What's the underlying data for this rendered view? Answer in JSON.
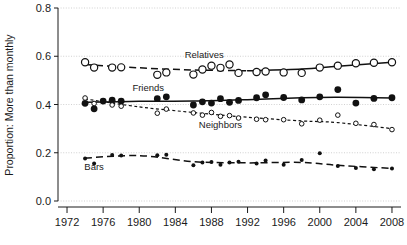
{
  "chart_data": {
    "type": "scatter",
    "title": "",
    "xlabel": "",
    "ylabel": "Proportion: More than monthly",
    "xlim": [
      1971,
      2009
    ],
    "ylim": [
      0.0,
      0.8
    ],
    "grid": true,
    "legend_position": "inline-annotations",
    "x_ticks": [
      "1972",
      "1976",
      "1980",
      "1984",
      "1988",
      "1992",
      "1996",
      "2000",
      "2004",
      "2008"
    ],
    "x_tick_values": [
      1972,
      1976,
      1980,
      1984,
      1988,
      1992,
      1996,
      2000,
      2004,
      2008
    ],
    "y_ticks": [
      "0.0",
      "0.2",
      "0.4",
      "0.6",
      "0.8"
    ],
    "y_tick_values": [
      0.0,
      0.2,
      0.4,
      0.6,
      0.8
    ],
    "series": [
      {
        "name": "Relatives",
        "marker": "open-circle",
        "line_style": "dashed-then-solid",
        "label_x": 1987.2,
        "label_y": 0.593,
        "x": [
          1974,
          1975,
          1977,
          1978,
          1982,
          1983,
          1986,
          1987,
          1988,
          1989,
          1990,
          1991,
          1993,
          1994,
          1996,
          1998,
          2000,
          2002,
          2004,
          2006,
          2008
        ],
        "values": [
          0.575,
          0.553,
          0.553,
          0.554,
          0.523,
          0.533,
          0.524,
          0.545,
          0.561,
          0.552,
          0.566,
          0.531,
          0.535,
          0.537,
          0.533,
          0.531,
          0.553,
          0.561,
          0.571,
          0.573,
          0.575
        ],
        "trend_x": [
          1974,
          1980,
          1986,
          1992,
          1998,
          2002,
          2008
        ],
        "trend_y": [
          0.566,
          0.552,
          0.543,
          0.54,
          0.547,
          0.559,
          0.575
        ]
      },
      {
        "name": "Friends",
        "marker": "filled-circle",
        "line_style": "solid",
        "label_x": 1981.0,
        "label_y": 0.455,
        "x": [
          1974,
          1975,
          1976,
          1977,
          1978,
          1982,
          1983,
          1986,
          1987,
          1988,
          1989,
          1990,
          1991,
          1993,
          1994,
          1996,
          1998,
          2000,
          2002,
          2004,
          2006,
          2008
        ],
        "values": [
          0.405,
          0.382,
          0.414,
          0.418,
          0.414,
          0.424,
          0.432,
          0.398,
          0.411,
          0.406,
          0.424,
          0.409,
          0.417,
          0.428,
          0.44,
          0.429,
          0.419,
          0.432,
          0.462,
          0.406,
          0.425,
          0.428
        ],
        "trend_x": [
          1974,
          1980,
          1986,
          1992,
          1998,
          2002,
          2008
        ],
        "trend_y": [
          0.409,
          0.413,
          0.414,
          0.42,
          0.428,
          0.43,
          0.427
        ]
      },
      {
        "name": "Neighbors",
        "marker": "open-circle-small",
        "line_style": "dotted",
        "label_x": 1989.0,
        "label_y": 0.303,
        "x": [
          1974,
          1975,
          1977,
          1978,
          1982,
          1983,
          1986,
          1987,
          1988,
          1989,
          1990,
          1991,
          1993,
          1994,
          1996,
          1998,
          2000,
          2002,
          2004,
          2006,
          2008
        ],
        "values": [
          0.427,
          0.404,
          0.398,
          0.393,
          0.364,
          0.381,
          0.365,
          0.356,
          0.367,
          0.351,
          0.354,
          0.344,
          0.339,
          0.337,
          0.337,
          0.32,
          0.335,
          0.356,
          0.322,
          0.317,
          0.296
        ],
        "trend_x": [
          1974,
          1980,
          1986,
          1992,
          1998,
          2002,
          2008
        ],
        "trend_y": [
          0.423,
          0.39,
          0.367,
          0.347,
          0.332,
          0.325,
          0.3
        ]
      },
      {
        "name": "Bars",
        "marker": "filled-circle-small",
        "line_style": "dashed",
        "label_x": 1975.0,
        "label_y": 0.128,
        "x": [
          1974,
          1975,
          1977,
          1978,
          1982,
          1983,
          1986,
          1987,
          1988,
          1989,
          1990,
          1991,
          1993,
          1994,
          1996,
          1998,
          2000,
          2002,
          2004,
          2006,
          2008
        ],
        "values": [
          0.176,
          0.155,
          0.191,
          0.189,
          0.19,
          0.192,
          0.148,
          0.16,
          0.162,
          0.15,
          0.16,
          0.163,
          0.155,
          0.168,
          0.15,
          0.17,
          0.198,
          0.145,
          0.137,
          0.132,
          0.135
        ],
        "trend_x": [
          1974,
          1980,
          1986,
          1992,
          1998,
          2002,
          2008
        ],
        "trend_y": [
          0.178,
          0.188,
          0.163,
          0.158,
          0.16,
          0.148,
          0.135
        ]
      }
    ]
  }
}
